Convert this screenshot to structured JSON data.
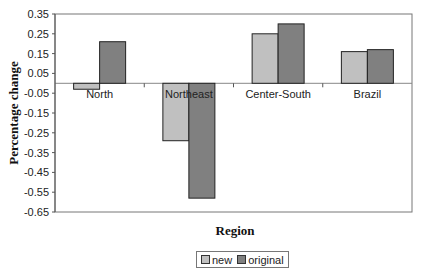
{
  "chart_data": {
    "type": "bar",
    "title": "",
    "xlabel": "Region",
    "ylabel": "Percentage change",
    "categories": [
      "North",
      "Northeast",
      "Center-South",
      "Brazil"
    ],
    "series": [
      {
        "name": "new",
        "color": "#c0c0c0",
        "values": [
          -0.03,
          -0.29,
          0.25,
          0.16
        ]
      },
      {
        "name": "original",
        "color": "#808080",
        "values": [
          0.21,
          -0.58,
          0.3,
          0.17
        ]
      }
    ],
    "ylim": [
      -0.65,
      0.35
    ],
    "yticks": [
      0.35,
      0.25,
      0.15,
      0.05,
      -0.05,
      -0.15,
      -0.25,
      -0.35,
      -0.45,
      -0.55,
      -0.65
    ],
    "ytick_labels": [
      "0.35",
      "0.25",
      "0.15",
      "0.05",
      "-0.05",
      "-0.15",
      "-0.25",
      "-0.35",
      "-0.45",
      "-0.55",
      "-0.65"
    ],
    "grid": false,
    "legend_position": "bottom"
  },
  "legend": {
    "items": [
      {
        "label": "new",
        "color": "#c0c0c0"
      },
      {
        "label": "original",
        "color": "#808080"
      }
    ]
  }
}
